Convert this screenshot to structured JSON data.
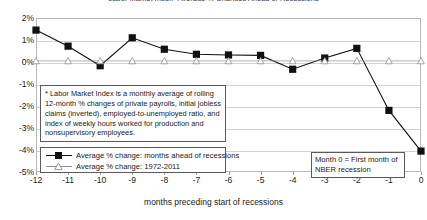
{
  "chart_data": {
    "type": "line",
    "title": "Labor Market Index* Average % Changes Ahead of Recessions",
    "xlabel": "months preceding start of recessions",
    "ylabel": "",
    "x": [
      -12,
      -11,
      -10,
      -9,
      -8,
      -7,
      -6,
      -5,
      -4,
      -3,
      -2,
      -1,
      0
    ],
    "categories": [
      "-12",
      "-11",
      "-10",
      "-9",
      "-8",
      "-7",
      "-6",
      "-5",
      "-4",
      "-3",
      "-2",
      "-1",
      "0"
    ],
    "ylim": [
      -5,
      2
    ],
    "yticks": [
      2,
      1,
      0,
      -1,
      -2,
      -3,
      -4,
      -5
    ],
    "ytick_labels": [
      "2%",
      "1%",
      "0%",
      "-1%",
      "-2%",
      "-3%",
      "-4%",
      "-5%"
    ],
    "grid": true,
    "legend_position": "lower-left",
    "series": [
      {
        "name": "Average % change: months ahead of recessions",
        "marker": "filled-square",
        "color": "#111111",
        "values": [
          1.45,
          0.72,
          -0.17,
          1.1,
          0.58,
          0.35,
          0.32,
          0.3,
          -0.33,
          0.18,
          0.62,
          -2.2,
          -4.05
        ]
      },
      {
        "name": "Average % change: 1972-2011",
        "marker": "open-triangle",
        "color": "#8f8f93",
        "values": [
          0.05,
          0.05,
          0.05,
          0.05,
          0.05,
          0.05,
          0.05,
          0.05,
          0.05,
          0.05,
          0.05,
          0.05,
          0.05
        ]
      }
    ],
    "annotations": [
      {
        "name": "footnote",
        "text": "* Labor Market Index is a monthly average of rolling 12-month % changes of private payrolls, initial jobless claims (inverted), employed-to-unemployed ratio, and index of weekly hours worked for production and nonsupervisory employees."
      },
      {
        "name": "month-zero-callout",
        "text": "Month 0 = First month of NBER recession"
      }
    ]
  },
  "legend": {
    "series_1_label": "Average % change: months ahead of recessions",
    "series_2_label": "Average % change: 1972-2011"
  },
  "callout": {
    "text": "Month 0 = First month of NBER recession"
  },
  "footnote": {
    "text": "* Labor Market Index is a monthly average of rolling 12-month % changes of private payrolls, initial jobless claims (inverted), employed-to-unemployed ratio, and index of weekly hours worked for production and nonsupervisory employees."
  }
}
